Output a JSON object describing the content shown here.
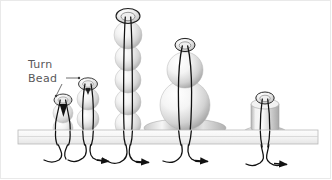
{
  "figure": {
    "background_color": "#ffffff",
    "border_color": "#e9e9e9",
    "line_color": "#1a1a1a",
    "label_color": "#58585a",
    "bead_fill_light": "#f4f4f4",
    "bead_fill_mid": "#d8d8d8",
    "bead_fill_dark": "#9d9d9d",
    "bar_fill": "#f0f0f0",
    "bar_stroke": "#b8b8b8"
  },
  "annotation": {
    "line1": "Turn",
    "line2": "Bead",
    "leader_count": 2
  },
  "loom_bar": {
    "name": "warp-bar",
    "x": 18,
    "y": 130,
    "width": 300,
    "height": 14
  },
  "stacks": [
    {
      "id": 1,
      "name": "stack-1",
      "center_x": 63,
      "turn_bead": {
        "type": "ring",
        "rx": 9,
        "ry": 6,
        "cy": 100
      },
      "beads": [
        {
          "type": "sphere",
          "r": 10,
          "cy": 113
        },
        {
          "type": "sphere",
          "r": 10,
          "cy": 128
        }
      ],
      "has_disc": false,
      "arrow": false
    },
    {
      "id": 2,
      "name": "stack-2",
      "center_x": 88,
      "turn_bead": {
        "type": "ring",
        "rx": 9,
        "ry": 6,
        "cy": 84
      },
      "beads": [
        {
          "type": "sphere",
          "r": 11,
          "cy": 99
        },
        {
          "type": "sphere",
          "r": 11,
          "cy": 119
        }
      ],
      "has_disc": false,
      "arrow": true
    },
    {
      "id": 3,
      "name": "stack-3",
      "center_x": 128,
      "turn_bead": {
        "type": "ring",
        "rx": 11,
        "ry": 7,
        "cy": 16
      },
      "beads": [
        {
          "type": "sphere",
          "r": 13,
          "cy": 35
        },
        {
          "type": "sphere",
          "r": 13,
          "cy": 58
        },
        {
          "type": "sphere",
          "r": 13,
          "cy": 80
        },
        {
          "type": "sphere",
          "r": 13,
          "cy": 102
        },
        {
          "type": "sphere",
          "r": 13,
          "cy": 124
        }
      ],
      "has_disc": false,
      "arrow": true
    },
    {
      "id": 4,
      "name": "stack-4",
      "center_x": 185,
      "turn_bead": {
        "type": "ring",
        "rx": 10,
        "ry": 7,
        "cy": 45
      },
      "beads": [
        {
          "type": "sphere",
          "r": 18,
          "cy": 70
        },
        {
          "type": "sphere",
          "r": 24,
          "cy": 105
        }
      ],
      "has_disc": true,
      "disc": {
        "rx": 40,
        "ry": 9,
        "cy": 128
      },
      "arrow": true
    },
    {
      "id": 5,
      "name": "stack-5",
      "center_x": 265,
      "turn_bead": {
        "type": "ring",
        "rx": 9,
        "ry": 6,
        "cy": 98
      },
      "beads": [
        {
          "type": "cylinder",
          "rx": 14,
          "top": 105,
          "height": 25
        }
      ],
      "has_disc": true,
      "disc": {
        "rx": 22,
        "ry": 7,
        "cy": 133
      },
      "arrow": true
    }
  ],
  "threads": {
    "description": "warp threads looping around bar with directional arrows",
    "arrow_count": 4
  }
}
